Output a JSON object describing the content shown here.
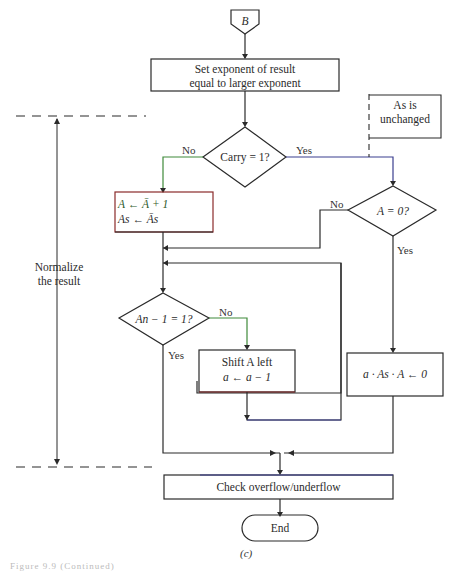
{
  "connector": {
    "label": "B"
  },
  "nodes": {
    "set_exponent": {
      "line1": "Set exponent of result",
      "line2": "equal to larger exponent"
    },
    "carry_decision": {
      "text": "Carry = 1?",
      "no_label": "No",
      "yes_label": "Yes"
    },
    "complement_box": {
      "line1": "A ← Ā + 1",
      "line2": "As ← Ās"
    },
    "as_unchanged_note": {
      "line1": "As is",
      "line2": "unchanged"
    },
    "a_zero_decision": {
      "text": "A = 0?",
      "no_label": "No",
      "yes_label": "Yes"
    },
    "msb_decision": {
      "text": "An − 1 = 1?",
      "no_label": "No",
      "yes_label": "Yes"
    },
    "shift_box": {
      "line1": "Shift A left",
      "line2": "a ← a − 1"
    },
    "zero_box": {
      "text": "a · As · A ← 0"
    },
    "check_box": {
      "text": "Check overflow/underflow"
    },
    "end_terminal": {
      "text": "End"
    }
  },
  "annotations": {
    "normalize_label_line1": "Normalize",
    "normalize_label_line2": "the result"
  },
  "subfigure_label": "(c)",
  "figure_caption": "Figure 9.9 (Continued)",
  "colors": {
    "line": "#2a2a2a",
    "green_accent": "#3f8a3a",
    "blue_accent": "#3b3f8f",
    "red_accent": "#8a2a2a"
  }
}
